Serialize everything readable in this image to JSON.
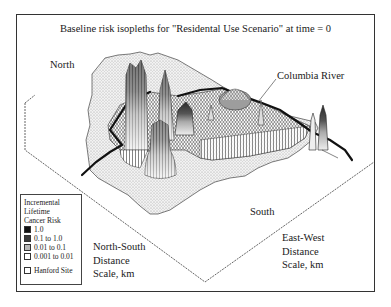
{
  "figure": {
    "title": "Baseline risk isopleths for \"Residental Use Scenario\" at time = 0",
    "labels": {
      "north": "North",
      "south": "South",
      "river": "Columbia River",
      "ns_axis": [
        "North-South",
        "Distance",
        "Scale, km"
      ],
      "ew_axis": [
        "East-West",
        "Distance",
        "Scale, km"
      ]
    },
    "legend": {
      "title_lines": [
        "Incremental",
        "Lifetime",
        "Cancer Risk"
      ],
      "items": [
        {
          "label": "1.0",
          "color": "#111111"
        },
        {
          "label": "0.1 to 1.0",
          "color": "#3a3a3a"
        },
        {
          "label": "0.01 to 0.1",
          "color": "#b8b8b8"
        },
        {
          "label": "0.001 to 0.01",
          "color": "#ffffff"
        }
      ],
      "site": {
        "label": "Hanford Site",
        "color": "#ffffff"
      }
    },
    "colors": {
      "frame": "#333333",
      "site_fill": "#e4e4e4",
      "mesh": "#222222",
      "river": "#111111"
    }
  }
}
